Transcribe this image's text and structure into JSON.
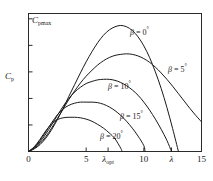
{
  "chart_data": {
    "type": "line",
    "title": "",
    "xlabel": "λ",
    "ylabel": "C_p",
    "y_top_label": "C",
    "y_top_sub": "pmax",
    "y_label_main": "C",
    "y_label_sub": "p",
    "xlim": [
      0,
      15
    ],
    "ylim": [
      0,
      0.52
    ],
    "grid": false,
    "legend_position": "inline-annotations",
    "xticks": [
      {
        "value": 0,
        "label": "0",
        "italic": false
      },
      {
        "value": 5,
        "label": "5",
        "italic": false
      },
      {
        "value": 6.9,
        "label": "λ",
        "sub": "opt",
        "italic": true
      },
      {
        "value": 10,
        "label": "10",
        "italic": false
      },
      {
        "value": 12.4,
        "label": "λ",
        "italic": true
      },
      {
        "value": 15,
        "label": "15",
        "italic": false
      }
    ],
    "yticks": [
      0.1,
      0.2,
      0.3,
      0.4,
      0.5
    ],
    "series": [
      {
        "name": "β = 0°",
        "beta_deg": 0,
        "label_symbol": "β",
        "label_value": "0",
        "label_unit": "°",
        "peak_lambda": 8.0,
        "peak_cp": 0.475,
        "zero_crossing": 13.0,
        "points": [
          [
            0.0,
            0.0
          ],
          [
            0.5,
            0.01
          ],
          [
            1.0,
            0.026
          ],
          [
            1.5,
            0.05
          ],
          [
            2.0,
            0.082
          ],
          [
            2.5,
            0.12
          ],
          [
            3.0,
            0.162
          ],
          [
            3.5,
            0.208
          ],
          [
            4.0,
            0.252
          ],
          [
            4.5,
            0.296
          ],
          [
            5.0,
            0.338
          ],
          [
            5.5,
            0.376
          ],
          [
            6.0,
            0.41
          ],
          [
            6.5,
            0.438
          ],
          [
            7.0,
            0.458
          ],
          [
            7.5,
            0.47
          ],
          [
            8.0,
            0.475
          ],
          [
            8.5,
            0.47
          ],
          [
            9.0,
            0.456
          ],
          [
            9.5,
            0.432
          ],
          [
            10.0,
            0.398
          ],
          [
            10.5,
            0.354
          ],
          [
            11.0,
            0.3
          ],
          [
            11.5,
            0.238
          ],
          [
            12.0,
            0.166
          ],
          [
            12.5,
            0.086
          ],
          [
            13.0,
            0.0
          ]
        ]
      },
      {
        "name": "β = 5°",
        "beta_deg": 5,
        "label_symbol": "β",
        "label_value": "5",
        "label_unit": "°",
        "peak_lambda": 8.6,
        "peak_cp": 0.368,
        "zero_crossing": null,
        "points": [
          [
            0.0,
            0.0
          ],
          [
            0.5,
            0.012
          ],
          [
            1.0,
            0.03
          ],
          [
            1.5,
            0.056
          ],
          [
            2.0,
            0.088
          ],
          [
            2.5,
            0.124
          ],
          [
            3.0,
            0.16
          ],
          [
            3.5,
            0.196
          ],
          [
            4.0,
            0.228
          ],
          [
            4.5,
            0.258
          ],
          [
            5.0,
            0.284
          ],
          [
            5.5,
            0.306
          ],
          [
            6.0,
            0.326
          ],
          [
            6.5,
            0.342
          ],
          [
            7.0,
            0.354
          ],
          [
            7.5,
            0.362
          ],
          [
            8.0,
            0.366
          ],
          [
            8.5,
            0.368
          ],
          [
            9.0,
            0.366
          ],
          [
            9.5,
            0.36
          ],
          [
            10.0,
            0.35
          ],
          [
            10.5,
            0.336
          ],
          [
            11.0,
            0.318
          ],
          [
            11.5,
            0.296
          ],
          [
            12.0,
            0.272
          ],
          [
            12.5,
            0.246
          ],
          [
            13.0,
            0.218
          ],
          [
            13.5,
            0.19
          ],
          [
            14.0,
            0.162
          ],
          [
            14.5,
            0.136
          ],
          [
            15.0,
            0.112
          ]
        ]
      },
      {
        "name": "β = 10°",
        "beta_deg": 10,
        "label_symbol": "β",
        "label_value": "10",
        "label_unit": "°",
        "peak_lambda": 7.0,
        "peak_cp": 0.272,
        "zero_crossing": 12.4,
        "points": [
          [
            0.0,
            0.0
          ],
          [
            0.5,
            0.014
          ],
          [
            1.0,
            0.036
          ],
          [
            1.5,
            0.066
          ],
          [
            2.0,
            0.1
          ],
          [
            2.5,
            0.136
          ],
          [
            3.0,
            0.17
          ],
          [
            3.5,
            0.2
          ],
          [
            4.0,
            0.224
          ],
          [
            4.5,
            0.242
          ],
          [
            5.0,
            0.256
          ],
          [
            5.5,
            0.264
          ],
          [
            6.0,
            0.27
          ],
          [
            6.5,
            0.272
          ],
          [
            7.0,
            0.272
          ],
          [
            7.5,
            0.268
          ],
          [
            8.0,
            0.26
          ],
          [
            8.5,
            0.248
          ],
          [
            9.0,
            0.232
          ],
          [
            9.5,
            0.212
          ],
          [
            10.0,
            0.186
          ],
          [
            10.5,
            0.156
          ],
          [
            11.0,
            0.122
          ],
          [
            11.5,
            0.084
          ],
          [
            12.0,
            0.042
          ],
          [
            12.4,
            0.0
          ]
        ]
      },
      {
        "name": "β = 15°",
        "beta_deg": 15,
        "label_symbol": "β",
        "label_value": "15",
        "label_unit": "°",
        "peak_lambda": 5.6,
        "peak_cp": 0.186,
        "zero_crossing": 10.1,
        "points": [
          [
            0.0,
            0.0
          ],
          [
            0.5,
            0.016
          ],
          [
            1.0,
            0.042
          ],
          [
            1.5,
            0.074
          ],
          [
            2.0,
            0.108
          ],
          [
            2.5,
            0.138
          ],
          [
            3.0,
            0.16
          ],
          [
            3.5,
            0.174
          ],
          [
            4.0,
            0.182
          ],
          [
            4.5,
            0.186
          ],
          [
            5.0,
            0.186
          ],
          [
            5.5,
            0.186
          ],
          [
            6.0,
            0.184
          ],
          [
            6.5,
            0.178
          ],
          [
            7.0,
            0.168
          ],
          [
            7.5,
            0.154
          ],
          [
            8.0,
            0.136
          ],
          [
            8.5,
            0.114
          ],
          [
            9.0,
            0.088
          ],
          [
            9.5,
            0.058
          ],
          [
            10.0,
            0.022
          ],
          [
            10.1,
            0.0
          ]
        ]
      },
      {
        "name": "β = 20°",
        "beta_deg": 20,
        "label_symbol": "β",
        "label_value": "20",
        "label_unit": "°",
        "peak_lambda": 4.3,
        "peak_cp": 0.128,
        "zero_crossing": 8.1,
        "points": [
          [
            0.0,
            0.0
          ],
          [
            0.5,
            0.018
          ],
          [
            1.0,
            0.046
          ],
          [
            1.5,
            0.078
          ],
          [
            2.0,
            0.104
          ],
          [
            2.5,
            0.12
          ],
          [
            3.0,
            0.127
          ],
          [
            3.5,
            0.129
          ],
          [
            4.0,
            0.129
          ],
          [
            4.5,
            0.127
          ],
          [
            5.0,
            0.122
          ],
          [
            5.5,
            0.114
          ],
          [
            6.0,
            0.102
          ],
          [
            6.5,
            0.088
          ],
          [
            7.0,
            0.07
          ],
          [
            7.5,
            0.048
          ],
          [
            8.0,
            0.012
          ],
          [
            8.1,
            0.0
          ]
        ]
      }
    ],
    "annotations": [
      {
        "text": "β = 0°",
        "x_px": 130,
        "y_px": 26
      },
      {
        "text": "β = 5°",
        "x_px": 168,
        "y_px": 63
      },
      {
        "text": "β = 10°",
        "x_px": 108,
        "y_px": 80
      },
      {
        "text": "β = 15°",
        "x_px": 120,
        "y_px": 110
      },
      {
        "text": "β = 20°",
        "x_px": 100,
        "y_px": 130
      }
    ],
    "colors": {
      "curve": "#1a1a1a",
      "axis": "#2b2b2b",
      "background": "#ffffff"
    }
  }
}
